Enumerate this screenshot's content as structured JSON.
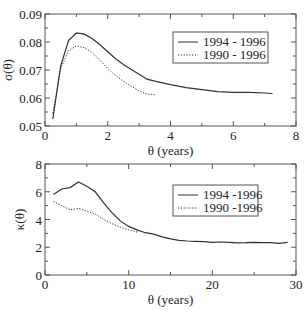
{
  "chart_data": [
    {
      "type": "line",
      "title": "",
      "xlabel": "θ (years)",
      "ylabel": "σ(θ)",
      "xlim": [
        0,
        8
      ],
      "ylim": [
        0.05,
        0.09
      ],
      "xticks": [
        0,
        2,
        4,
        6,
        8
      ],
      "xtick_labels": [
        "0",
        "2",
        "4",
        "6",
        "8"
      ],
      "yticks": [
        0.05,
        0.06,
        0.07,
        0.08,
        0.09
      ],
      "ytick_labels": [
        "0.05",
        "0.06",
        "0.07",
        "0.08",
        "0.09"
      ],
      "grid": false,
      "legend_position": "upper right",
      "series": [
        {
          "name": "1994 - 1996",
          "style": "solid",
          "x": [
            0.25,
            0.5,
            0.75,
            1.0,
            1.25,
            1.5,
            1.75,
            2.0,
            2.25,
            2.5,
            2.75,
            3.0,
            3.25,
            3.5,
            4.0,
            4.5,
            5.0,
            5.5,
            6.0,
            6.5,
            7.0,
            7.25
          ],
          "values": [
            0.0525,
            0.0715,
            0.0805,
            0.0832,
            0.0828,
            0.0812,
            0.079,
            0.0765,
            0.074,
            0.072,
            0.0702,
            0.0685,
            0.0667,
            0.066,
            0.0648,
            0.0637,
            0.063,
            0.0623,
            0.062,
            0.062,
            0.0618,
            0.0616
          ]
        },
        {
          "name": "1990 - 1996",
          "style": "dotted",
          "x": [
            0.25,
            0.5,
            0.75,
            1.0,
            1.25,
            1.5,
            1.75,
            2.0,
            2.25,
            2.5,
            2.75,
            3.0,
            3.25,
            3.5
          ],
          "values": [
            0.0545,
            0.0705,
            0.077,
            0.0786,
            0.078,
            0.0762,
            0.0735,
            0.0705,
            0.068,
            0.066,
            0.0642,
            0.0625,
            0.0614,
            0.0612
          ]
        }
      ]
    },
    {
      "type": "line",
      "title": "",
      "xlabel": "θ (years)",
      "ylabel": "κ(θ)",
      "xlim": [
        0,
        30
      ],
      "ylim": [
        0,
        8
      ],
      "xticks": [
        0,
        10,
        20,
        30
      ],
      "xtick_labels": [
        "0",
        "10",
        "20",
        "30"
      ],
      "yticks": [
        0,
        2,
        4,
        6,
        8
      ],
      "ytick_labels": [
        "0",
        "2",
        "4",
        "6",
        "8"
      ],
      "grid": false,
      "legend_position": "upper right",
      "series": [
        {
          "name": "1994 -1996",
          "style": "solid",
          "x": [
            1,
            2,
            3,
            4,
            5,
            6,
            7,
            8,
            9,
            10,
            11,
            12,
            13,
            14,
            15,
            16,
            17,
            18,
            19,
            20,
            21,
            22,
            23,
            24,
            25,
            26,
            27,
            28,
            29
          ],
          "values": [
            5.8,
            6.2,
            6.3,
            6.7,
            6.4,
            6.0,
            5.2,
            4.5,
            3.9,
            3.5,
            3.25,
            3.05,
            2.95,
            2.75,
            2.6,
            2.5,
            2.45,
            2.42,
            2.4,
            2.35,
            2.38,
            2.35,
            2.32,
            2.33,
            2.36,
            2.33,
            2.33,
            2.28,
            2.35
          ]
        },
        {
          "name": "1990 -1996",
          "style": "dotted",
          "x": [
            1,
            2,
            3,
            4,
            5,
            6,
            7,
            8,
            9,
            10,
            11
          ],
          "values": [
            5.3,
            5.0,
            4.7,
            4.8,
            4.6,
            4.4,
            4.0,
            3.7,
            3.45,
            3.25,
            3.1
          ]
        }
      ]
    }
  ],
  "panels": [
    {
      "box": {
        "left": 45,
        "top": 14,
        "right": 296,
        "bottom": 126
      },
      "legend": {
        "left": 173,
        "top": 32,
        "width": 95,
        "height": 31
      }
    },
    {
      "box": {
        "left": 45,
        "top": 164,
        "right": 296,
        "bottom": 275
      },
      "legend": {
        "left": 173,
        "top": 185,
        "width": 85,
        "height": 31
      }
    }
  ],
  "colors": {
    "line": "#333333",
    "axis": "#555555"
  }
}
